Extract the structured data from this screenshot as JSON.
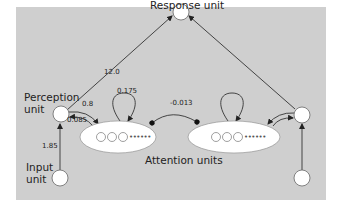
{
  "diagram": {
    "type": "neural-network-model",
    "nodes": {
      "response_unit": {
        "label": "Response unit"
      },
      "perception_unit": {
        "label_line1": "Perception",
        "label_line2": "unit"
      },
      "input_unit": {
        "label_line1": "Input",
        "label_line2": "unit"
      },
      "attention_units": {
        "label": "Attention units"
      },
      "right_perception_unit": {
        "label": ""
      },
      "right_input_unit": {
        "label": ""
      }
    },
    "weights": {
      "perception_to_response": "12.0",
      "perception_to_attention": "0.8",
      "attention_to_perception": "0.085",
      "attention_self": "0.175",
      "attention_lateral_inhibition": "-0.013",
      "input_to_perception": "1.85"
    },
    "ellipse_dots": "••••••"
  },
  "colors": {
    "panel": "#cfcfcf",
    "node_fill": "#ffffff",
    "stroke": "#333333"
  }
}
